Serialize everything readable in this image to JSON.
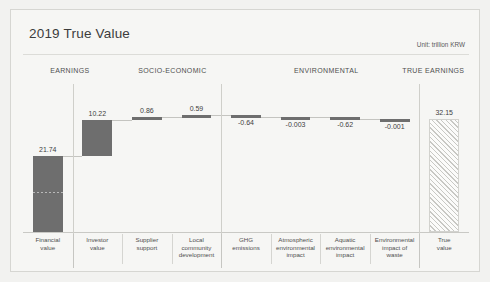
{
  "header": {
    "title": "2019 True Value",
    "unit": "Unit: trillion KRW"
  },
  "sections": [
    {
      "label": "EARNINGS",
      "center_pct": 10.5
    },
    {
      "label": "SOCIO-ECONOMIC",
      "center_pct": 33.5
    },
    {
      "label": "ENVIRONMENTAL",
      "center_pct": 68.0
    },
    {
      "label": "TRUE EARNINGS",
      "center_pct": 92.0
    }
  ],
  "chart_data": {
    "type": "bar",
    "subtype": "waterfall",
    "title": "2019 True Value",
    "unit": "trillion KRW",
    "xlabel": "",
    "ylabel": "",
    "grid": false,
    "legend": "none",
    "categories": [
      "Financial value",
      "Investor value",
      "Supplier support",
      "Local community development",
      "GHG emissions",
      "Atmospheric environmental impact",
      "Aquatic environmental impact",
      "Environmental impact of waste",
      "True value"
    ],
    "category_lines": [
      [
        "Financial",
        "value"
      ],
      [
        "Investor",
        "value"
      ],
      [
        "Supplier",
        "support"
      ],
      [
        "Local",
        "community",
        "development"
      ],
      [
        "GHG",
        "emissions"
      ],
      [
        "Atmospheric",
        "environmental",
        "impact"
      ],
      [
        "Aquatic",
        "environmental",
        "impact"
      ],
      [
        "Environmental",
        "impact of",
        "waste"
      ],
      [
        "True",
        "value"
      ]
    ],
    "values": [
      21.74,
      10.22,
      0.86,
      0.59,
      -0.64,
      -0.003,
      -0.62,
      -0.001,
      32.15
    ],
    "value_labels": [
      "21.74",
      "10.22",
      "0.86",
      "0.59",
      "-0.64",
      "-0.003",
      "-0.62",
      "-0.001",
      "32.15"
    ],
    "bar_kinds": [
      "total",
      "delta",
      "delta",
      "delta",
      "delta",
      "delta",
      "delta",
      "delta",
      "total"
    ],
    "groups": [
      "EARNINGS",
      "SOCIO-ECONOMIC",
      "SOCIO-ECONOMIC",
      "SOCIO-ECONOMIC",
      "ENVIRONMENTAL",
      "ENVIRONMENTAL",
      "ENVIRONMENTAL",
      "ENVIRONMENTAL",
      "TRUE EARNINGS"
    ],
    "cumulative_top": [
      21.74,
      31.96,
      32.82,
      33.41,
      32.77,
      32.767,
      32.147,
      32.146,
      32.15
    ],
    "cumulative_base": [
      0.0,
      21.74,
      31.96,
      32.82,
      33.41,
      32.77,
      32.767,
      32.147,
      0.0
    ],
    "ylim": [
      0,
      40
    ],
    "colors": {
      "bar": "#6e6e6e",
      "total_fill": "#fbfbfa",
      "hatch": "#c8c8c4",
      "background": "#f6f6f4",
      "text": "#4f4f4f"
    }
  }
}
